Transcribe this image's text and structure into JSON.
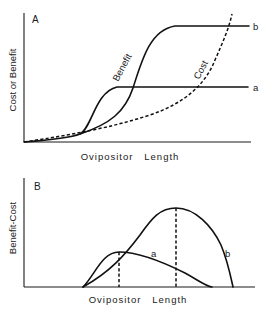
{
  "panel_a": {
    "letter": "A",
    "y_label": "Cost or Benefit",
    "x_label": "Ovipositor   Length",
    "curve_labels": {
      "benefit": "Benefit",
      "cost": "Cost",
      "a": "a",
      "b": "b"
    },
    "curves": {
      "benefit_a": "M24,142 C50,140 70,138 80,134 C92,128 95,92 117,87 L248,87",
      "benefit_b": "M80,134 C110,124 125,112 133,88 C142,60 150,30 175,26 L249,26",
      "cost": "M24,142 C70,135 110,128 150,115 C185,103 205,85 215,60 C223,42 229,28 232,14"
    }
  },
  "panel_b": {
    "letter": "B",
    "y_label": "Benefit-Cost",
    "x_label": "Ovipositor   Length",
    "curve_labels": {
      "a": "a",
      "b": "b"
    },
    "curves": {
      "a": "M83,287 C95,275 102,252 119,252 C140,252 165,263 185,273 C198,280 205,286 212,287",
      "b": "M83,287 C110,272 125,255 140,235 C152,218 160,208 176,208 C195,208 212,226 221,245 C228,262 231,278 233,287",
      "opt_a_x": 119,
      "opt_b_x": 176
    }
  }
}
